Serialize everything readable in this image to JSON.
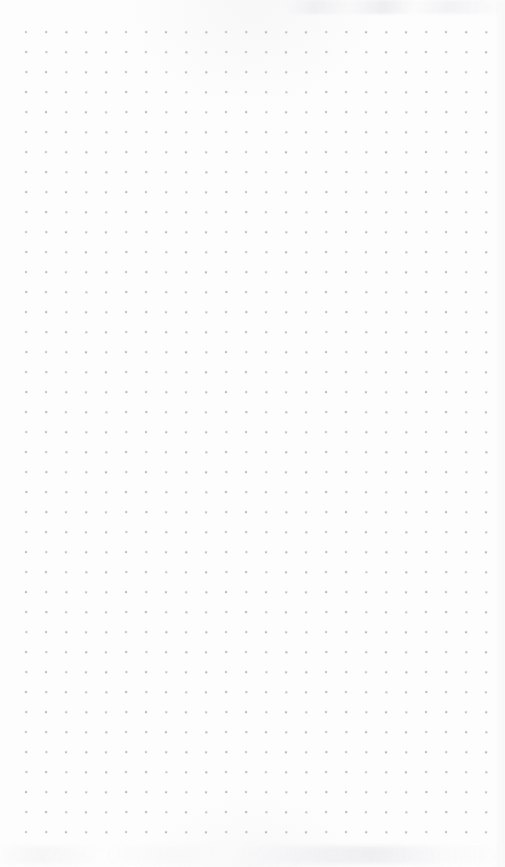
{
  "page": {
    "kind": "dot-grid-notebook-page",
    "width": 505,
    "height": 867,
    "background_color": "#fdfdfd",
    "content_text": "",
    "note": "Blank dot grid (bullet journal) page — no text, no handwriting, no UI chrome."
  },
  "dot_grid": {
    "columns": 24,
    "rows": 41,
    "spacing_px": 20,
    "origin_x": 26,
    "origin_y": 32,
    "last_dot_x": 486,
    "last_dot_y": 832,
    "dot_diameter_px": 1.7,
    "dot_color": "#b9b9c2",
    "margin_left_px": 26,
    "margin_top_px": 32,
    "margin_right_px": 19,
    "margin_bottom_px": 35
  },
  "artifacts": {
    "top_smudge_color": "#eeeef1",
    "bottom_smudge_color": "#f0f0f3",
    "edge_tint_color": "#f4f4f6"
  }
}
